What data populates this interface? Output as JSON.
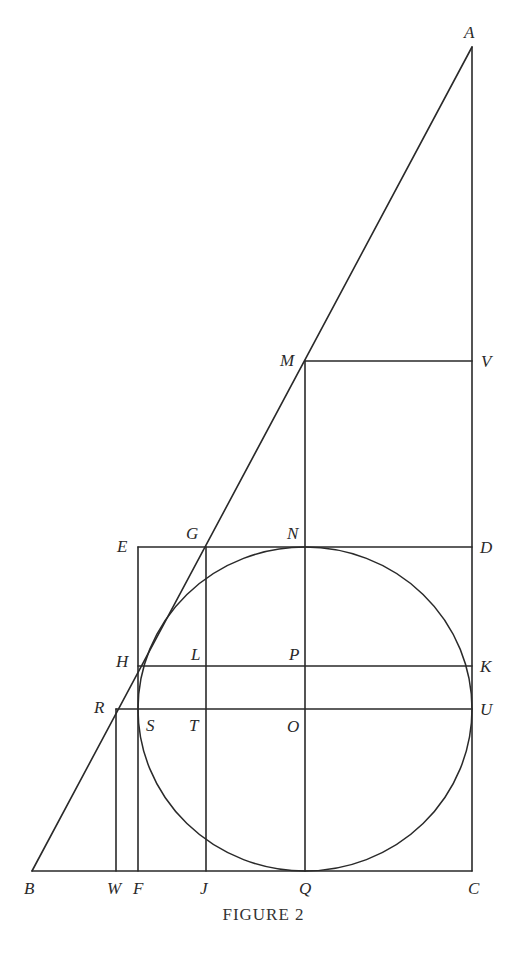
{
  "figure": {
    "caption": "FIGURE 2",
    "stroke_color": "#2a2a2a",
    "background": "#ffffff"
  },
  "points": {
    "A": {
      "label": "A",
      "x": 472,
      "y": 47
    },
    "B": {
      "label": "B",
      "x": 32,
      "y": 871
    },
    "C": {
      "label": "C",
      "x": 472,
      "y": 871
    },
    "D": {
      "label": "D",
      "x": 472,
      "y": 547
    },
    "E": {
      "label": "E",
      "x": 138,
      "y": 547
    },
    "F": {
      "label": "F",
      "x": 138,
      "y": 871
    },
    "G": {
      "label": "G",
      "x": 206,
      "y": 547
    },
    "H": {
      "label": "H",
      "x": 138,
      "y": 666
    },
    "J": {
      "label": "J",
      "x": 206,
      "y": 871
    },
    "K": {
      "label": "K",
      "x": 472,
      "y": 666
    },
    "L": {
      "label": "L",
      "x": 206,
      "y": 666
    },
    "M": {
      "label": "M",
      "x": 305,
      "y": 361
    },
    "N": {
      "label": "N",
      "x": 305,
      "y": 547
    },
    "O": {
      "label": "O",
      "x": 305,
      "y": 709
    },
    "P": {
      "label": "P",
      "x": 305,
      "y": 666
    },
    "Q": {
      "label": "Q",
      "x": 305,
      "y": 871
    },
    "R": {
      "label": "R",
      "x": 116,
      "y": 709
    },
    "S": {
      "label": "S",
      "x": 138,
      "y": 709
    },
    "T": {
      "label": "T",
      "x": 206,
      "y": 709
    },
    "U": {
      "label": "U",
      "x": 472,
      "y": 709
    },
    "V": {
      "label": "V",
      "x": 472,
      "y": 361
    },
    "W": {
      "label": "W",
      "x": 116,
      "y": 871
    }
  },
  "segments": [
    [
      "A",
      "B"
    ],
    [
      "B",
      "C"
    ],
    [
      "C",
      "A"
    ],
    [
      "M",
      "V"
    ],
    [
      "M",
      "Q"
    ],
    [
      "E",
      "D"
    ],
    [
      "E",
      "F"
    ],
    [
      "G",
      "J"
    ],
    [
      "H",
      "K"
    ],
    [
      "R",
      "U"
    ],
    [
      "R",
      "W"
    ]
  ],
  "ellipse": {
    "center": "O",
    "cx": 305,
    "cy": 709,
    "rx": 167,
    "ry": 162,
    "tangent_points": [
      "N",
      "Q",
      "S",
      "U"
    ]
  }
}
